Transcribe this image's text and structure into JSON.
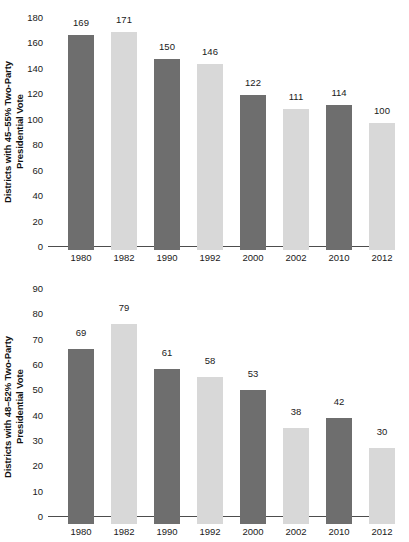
{
  "figure": {
    "background": "#ffffff",
    "bar_color_dark": "#6e6e6e",
    "bar_color_light": "#d8d8d8",
    "axis_color": "#4d4d4d"
  },
  "chart_data": [
    {
      "type": "bar",
      "title": "",
      "xlabel": "",
      "ylabel": "Districts with 45–55% Two-Party\nPresidential Vote",
      "categories": [
        "1980",
        "1982",
        "1990",
        "1992",
        "2000",
        "2002",
        "2010",
        "2012"
      ],
      "values": [
        169,
        171,
        150,
        146,
        122,
        111,
        114,
        100
      ],
      "value_labels": [
        "169",
        "171",
        "150",
        "146",
        "122",
        "111",
        "114",
        "100"
      ],
      "bar_colors": [
        "dark",
        "light",
        "dark",
        "light",
        "dark",
        "light",
        "dark",
        "light"
      ],
      "ylim": [
        0,
        180
      ],
      "yticks": [
        0,
        20,
        40,
        60,
        80,
        100,
        120,
        140,
        160,
        180
      ],
      "ytick_labels": [
        "0",
        "20",
        "40",
        "60",
        "80",
        "100",
        "120",
        "140",
        "160",
        "180"
      ],
      "grid": false,
      "legend": "none"
    },
    {
      "type": "bar",
      "title": "",
      "xlabel": "",
      "ylabel": "Districts with 48–52% Two-Party\nPresidential Vote",
      "categories": [
        "1980",
        "1982",
        "1990",
        "1992",
        "2000",
        "2002",
        "2010",
        "2012"
      ],
      "values": [
        69,
        79,
        61,
        58,
        53,
        38,
        42,
        30
      ],
      "value_labels": [
        "69",
        "79",
        "61",
        "58",
        "53",
        "38",
        "42",
        "30"
      ],
      "bar_colors": [
        "dark",
        "light",
        "dark",
        "light",
        "dark",
        "light",
        "dark",
        "light"
      ],
      "ylim": [
        0,
        90
      ],
      "yticks": [
        0,
        10,
        20,
        30,
        40,
        50,
        60,
        70,
        80,
        90
      ],
      "ytick_labels": [
        "0",
        "10",
        "20",
        "30",
        "40",
        "50",
        "60",
        "70",
        "80",
        "90"
      ],
      "grid": false,
      "legend": "none"
    }
  ]
}
